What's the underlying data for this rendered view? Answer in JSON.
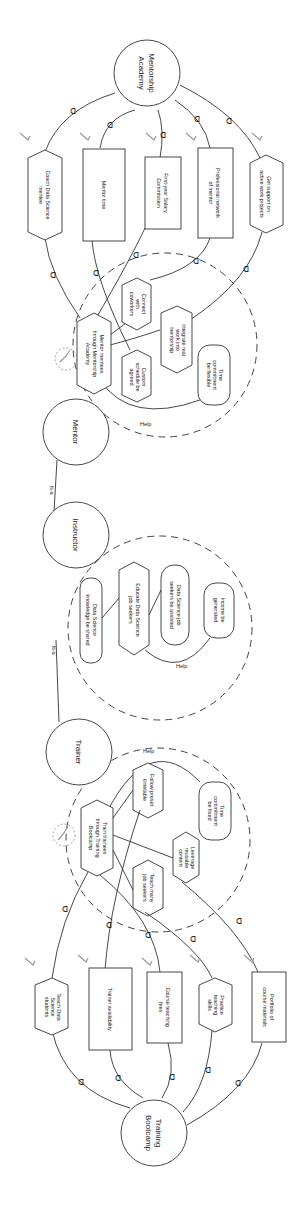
{
  "diagram": {
    "type": "iStar goal model (rotated 90°)",
    "actors": {
      "mentorship_academy": "Mentorship Academy",
      "mentorship_academy_l1": "Mentorship",
      "mentorship_academy_l2": "Academy",
      "mentor": "Mentor",
      "instructor": "Instructor",
      "trainer": "Trainer",
      "training_bootcamp": "Training Bootcamp",
      "training_bootcamp_l1": "Training",
      "training_bootcamp_l2": "Bootcamp"
    },
    "links": {
      "is_a_1": "Is-a",
      "is_a_2": "Is-a",
      "help_mentor": "Help",
      "help_instructor": "Help",
      "help_trainer": "Help"
    },
    "mentorship_dependums": [
      {
        "kind": "task",
        "l1": "Coach Data Science",
        "l2": "mentee"
      },
      {
        "kind": "resource",
        "l1": "Mentor time",
        "l2": ""
      },
      {
        "kind": "resource",
        "l1": "First-year Salary",
        "l2": "Commission"
      },
      {
        "kind": "resource",
        "l1": "Professional network",
        "l2": "of mentor"
      },
      {
        "kind": "task",
        "l1": "Get support on",
        "l2": "active work projects"
      }
    ],
    "mentor_elements": {
      "main_task": {
        "l1": "Mentor mentees",
        "l2": "through Mentorship",
        "l3": "Academy"
      },
      "connect": {
        "l1": "Connect",
        "l2": "with",
        "l3": "coworkers"
      },
      "custom": {
        "l1": "Custom",
        "l2": "schedule be",
        "l3": "agreed"
      },
      "integrate": {
        "l1": "Integrate real",
        "l2": "work into",
        "l3": "mentorship"
      },
      "time": {
        "l1": "Time",
        "l2": "commitment",
        "l3": "be flexible"
      }
    },
    "instructor_elements": {
      "knowledge": {
        "l1": "Data Science",
        "l2": "knowledge be shared"
      },
      "educate": {
        "l1": "Educate Data Science",
        "l2": "job seekers"
      },
      "assisted": {
        "l1": "Data Science job",
        "l2": "seekers be assisted"
      },
      "income": {
        "l1": "Income be",
        "l2": "generated"
      }
    },
    "trainer_elements": {
      "main_task": {
        "l1": "Train trainees",
        "l2": "through Training",
        "l3": "Bootcamp"
      },
      "follow": {
        "l1": "Follow preset",
        "l2": "timetable"
      },
      "time": {
        "l1": "Time",
        "l2": "commitment",
        "l3": "be fixed"
      },
      "teach_many": {
        "l1": "Teach many",
        "l2": "job seekers"
      },
      "leverage": {
        "l1": "Leverage",
        "l2": "reusable",
        "l3": "content"
      }
    },
    "bootcamp_dependums": [
      {
        "kind": "task",
        "l1": "Teach Data",
        "l2": "Science",
        "l3": "students"
      },
      {
        "kind": "resource",
        "l1": "Trainer availability",
        "l2": ""
      },
      {
        "kind": "resource",
        "l1": "Course teaching",
        "l2": "fees"
      },
      {
        "kind": "task",
        "l1": "Practice",
        "l2": "teaching",
        "l3": "skills"
      },
      {
        "kind": "resource",
        "l1": "Portfolio of",
        "l2": "course materials"
      }
    ],
    "colors": {
      "line": "#333333",
      "marker": "#999999",
      "background": "#ffffff"
    }
  }
}
